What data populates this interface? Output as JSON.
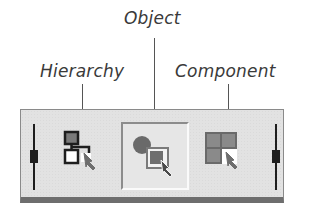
{
  "callouts": [
    {
      "id": "hierarchy",
      "label": "Hierarchy"
    },
    {
      "id": "object",
      "label": "Object"
    },
    {
      "id": "component",
      "label": "Component"
    }
  ],
  "toolbar": {
    "buttons": [
      {
        "id": "hierarchy",
        "icon": "hierarchy-select-icon",
        "selected": false
      },
      {
        "id": "object",
        "icon": "object-select-icon",
        "selected": true
      },
      {
        "id": "component",
        "icon": "component-select-icon",
        "selected": false
      }
    ]
  },
  "colors": {
    "panel": "#e2e2e2",
    "icon_fill": "#7a7a7a",
    "icon_stroke": "#1e1e1e",
    "label_text": "#3a3a3a"
  }
}
